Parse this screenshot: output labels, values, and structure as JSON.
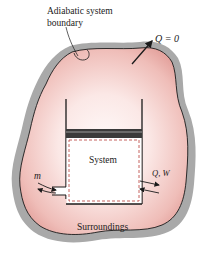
{
  "diagram": {
    "labels": {
      "boundary_line1": "Adiabatic system",
      "boundary_line2": "boundary",
      "heat_zero": "Q = 0",
      "system": "System",
      "mass_flow": "m",
      "heat_work": "Q, W",
      "surroundings": "Surroundings"
    },
    "colors": {
      "shadow": "#a9a9a9",
      "surroundings_fill_edge": "#e8a8a4",
      "surroundings_fill_center": "#fdf4f2",
      "boundary_line": "#1a1a1a",
      "piston": "#3a3a3a",
      "system_dashed": "#c0504d",
      "system_fill": "#ffffff"
    },
    "elements": [
      {
        "id": "surroundings-region",
        "kind": "blob"
      },
      {
        "id": "cylinder",
        "kind": "open-top container"
      },
      {
        "id": "piston",
        "kind": "bar"
      },
      {
        "id": "system-boundary",
        "kind": "dashed rectangle"
      },
      {
        "id": "inlet-pipe",
        "kind": "pipe",
        "label": "m"
      },
      {
        "id": "energy-arrows",
        "kind": "bidirectional arrows",
        "label": "Q, W"
      }
    ]
  }
}
